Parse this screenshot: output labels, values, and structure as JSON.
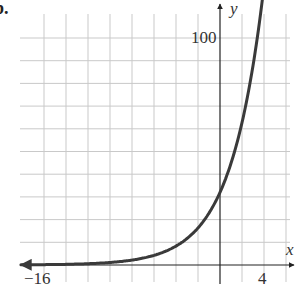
{
  "figure_label": "b.",
  "chart_data": {
    "type": "line",
    "title": "",
    "xlabel": "x",
    "ylabel": "y",
    "x_tick_labels": [
      {
        "value": -16,
        "label": "−16"
      },
      {
        "value": 4,
        "label": "4"
      }
    ],
    "y_tick_labels": [
      {
        "value": 100,
        "label": "100"
      }
    ],
    "xlim": [
      -18,
      6.5
    ],
    "ylim": [
      0,
      110
    ],
    "x_grid_step": 2,
    "y_grid_step": 10,
    "grid": true,
    "series": [
      {
        "name": "exponential growth curve",
        "description": "approx y = 32(1.4)^x",
        "x": [
          -18,
          -16,
          -14,
          -12,
          -10,
          -8,
          -6,
          -4,
          -2,
          0,
          1,
          2,
          3,
          4,
          4.5
        ],
        "y": [
          0.1,
          0.2,
          0.3,
          0.6,
          1.1,
          2.2,
          4.2,
          8.3,
          16,
          32,
          45,
          62,
          87,
          120,
          110
        ],
        "y_intercept": 32,
        "arrows": "both ends",
        "color": "#3a3a3a"
      }
    ]
  }
}
